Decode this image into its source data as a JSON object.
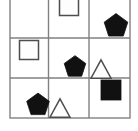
{
  "figure": {
    "type": "shape-grid",
    "background_color": "#ffffff",
    "grid": {
      "rows": 3,
      "columns": 3,
      "line_color": "#808080",
      "line_width": 1.4,
      "left": 10,
      "right": 130,
      "top": -6,
      "bottom": 118,
      "vertical_dividers": [
        48.5,
        89
      ],
      "horizontal_dividers": [
        38,
        78
      ],
      "top_row_clipped": true
    },
    "palette": {
      "fill_black": "#111111",
      "fill_white": "#fdfdfd",
      "stroke_dark": "#4d4d4d",
      "stroke_outline": "#555555"
    },
    "cells": [
      {
        "row": 1,
        "column": 1,
        "position_label": "top-left",
        "shape": "none",
        "fill": "none",
        "empty": true
      },
      {
        "row": 1,
        "column": 2,
        "position_label": "top-middle",
        "shape": "square",
        "shape_icon": "square-outline-icon",
        "fill": "white",
        "outlined": true,
        "clipped_by_top_edge": true,
        "center_x": 69,
        "center_y": 6,
        "size": 19
      },
      {
        "row": 1,
        "column": 3,
        "position_label": "top-right",
        "shape": "pentagon",
        "shape_icon": "pentagon-filled-icon",
        "fill": "black",
        "outlined": false,
        "center_x": 116,
        "center_y": 26,
        "size": 23
      },
      {
        "row": 2,
        "column": 1,
        "position_label": "middle-left",
        "shape": "square",
        "shape_icon": "square-outline-icon",
        "fill": "white",
        "outlined": true,
        "center_x": 29,
        "center_y": 50,
        "size": 19
      },
      {
        "row": 2,
        "column": 2,
        "position_label": "middle-center",
        "shape": "pentagon",
        "shape_icon": "pentagon-filled-icon",
        "fill": "black",
        "outlined": false,
        "center_x": 75,
        "center_y": 67,
        "size": 21
      },
      {
        "row": 2,
        "column": 3,
        "position_label": "middle-right",
        "shape": "triangle",
        "shape_icon": "triangle-outline-icon",
        "fill": "white",
        "outlined": true,
        "center_x": 101,
        "center_y": 69,
        "size": 20
      },
      {
        "row": 3,
        "column": 1,
        "position_label": "bottom-left",
        "shape": "pentagon",
        "shape_icon": "pentagon-filled-icon",
        "fill": "black",
        "outlined": false,
        "center_x": 38,
        "center_y": 105,
        "size": 22
      },
      {
        "row": 3,
        "column": 2,
        "position_label": "bottom-middle",
        "shape": "triangle",
        "shape_icon": "triangle-outline-icon",
        "fill": "white",
        "outlined": true,
        "center_x": 60,
        "center_y": 108,
        "size": 20
      },
      {
        "row": 3,
        "column": 3,
        "position_label": "bottom-right",
        "shape": "square",
        "shape_icon": "square-filled-icon",
        "fill": "black",
        "outlined": false,
        "center_x": 111,
        "center_y": 90,
        "size": 20
      }
    ]
  }
}
